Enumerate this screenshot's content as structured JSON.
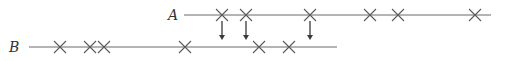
{
  "diagram": {
    "type": "event-timeline-matching",
    "lines": [
      {
        "id": "A",
        "label": "A",
        "events": [
          1,
          2,
          3,
          4,
          5,
          6
        ]
      },
      {
        "id": "B",
        "label": "B",
        "events": [
          1,
          2,
          3,
          4,
          5,
          6
        ]
      }
    ],
    "arrows": [
      {
        "from_line": "A",
        "from_event_index": 0
      },
      {
        "from_line": "A",
        "from_event_index": 1
      },
      {
        "from_line": "A",
        "from_event_index": 2
      }
    ],
    "colors": {
      "line": "#6a6a6a",
      "cross": "#5a5a5a",
      "arrow": "#3a3a3a",
      "label": "#333333"
    }
  }
}
